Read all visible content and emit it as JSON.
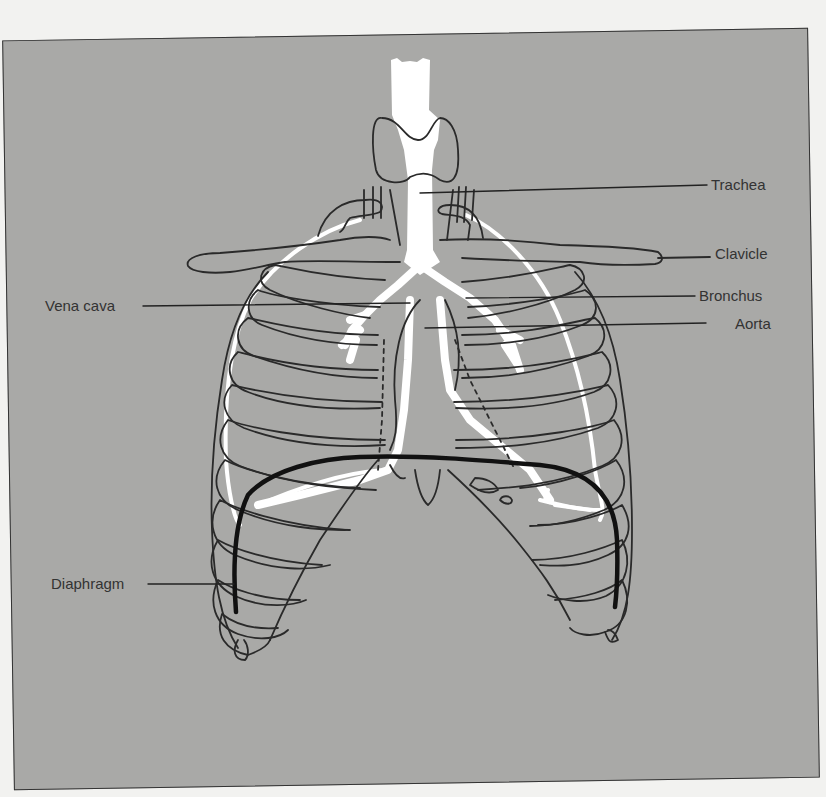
{
  "figure": {
    "background_color": "#a9a9a7",
    "line_color": "#2a2a2a",
    "highlight_color": "#ffffff",
    "diaphragm_color": "#111111"
  },
  "labels": {
    "trachea": "Trachea",
    "clavicle": "Clavicle",
    "vena_cava": "Vena cava",
    "bronchus": "Bronchus",
    "aorta": "Aorta",
    "diaphragm": "Diaphragm"
  }
}
